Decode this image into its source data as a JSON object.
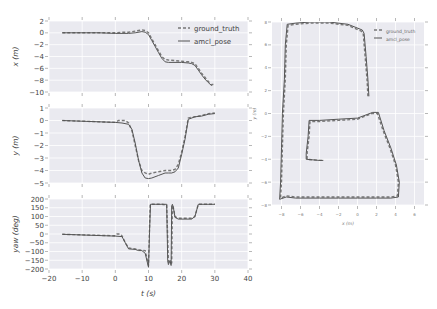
{
  "colors": {
    "plot_bg": "#eaeaf0",
    "grid": "#ffffff",
    "ground_truth": "#777777",
    "amcl_pose": "#555555"
  },
  "chart_data": [
    {
      "id": "x_vs_t",
      "type": "line",
      "title": "",
      "xlabel": "",
      "ylabel": "x (m)",
      "xlim": [
        -20,
        40
      ],
      "ylim": [
        -10,
        2
      ],
      "xticks": [],
      "yticks": [
        "2",
        "0",
        "−2",
        "−4",
        "−6",
        "−8",
        "−10"
      ],
      "ytick_values": [
        2,
        0,
        -2,
        -4,
        -6,
        -8,
        -10
      ],
      "grid": true,
      "legend": {
        "placement": "top-right",
        "entries": [
          "ground_truth",
          "amcl_pose"
        ]
      },
      "series": [
        {
          "name": "ground_truth",
          "style": "dashed",
          "x": [
            -16,
            -5,
            0,
            2,
            4,
            6,
            8,
            9,
            10,
            11,
            12,
            13,
            14,
            15,
            16,
            18,
            20,
            22,
            23,
            24,
            25,
            26,
            27,
            28,
            29,
            30
          ],
          "y": [
            0,
            0,
            0,
            0.1,
            0.1,
            0.3,
            0.5,
            0.4,
            0,
            -1,
            -2,
            -3,
            -4,
            -4.5,
            -4.6,
            -4.7,
            -4.8,
            -4.9,
            -5,
            -5.2,
            -6,
            -6.8,
            -7.5,
            -8.2,
            -8.8,
            -8.6
          ]
        },
        {
          "name": "amcl_pose",
          "style": "solid",
          "x": [
            -16,
            -5,
            0,
            2,
            4,
            6,
            8,
            9,
            10,
            11,
            12,
            13,
            14,
            15,
            16,
            18,
            20,
            22,
            23,
            24,
            25,
            26,
            27,
            28,
            29
          ],
          "y": [
            0,
            0,
            -0.1,
            -0.1,
            -0.1,
            0,
            0.2,
            0.1,
            -0.3,
            -1.3,
            -2.3,
            -3.3,
            -4.3,
            -4.9,
            -5,
            -5,
            -5,
            -5.1,
            -5.2,
            -5.5,
            -6.3,
            -7.1,
            -7.8,
            -8.4,
            -8.9
          ]
        }
      ]
    },
    {
      "id": "y_vs_t",
      "type": "line",
      "title": "",
      "xlabel": "",
      "ylabel": "y (m)",
      "xlim": [
        -20,
        40
      ],
      "ylim": [
        -5,
        1
      ],
      "xticks": [],
      "yticks": [
        "1",
        "0",
        "−1",
        "−2",
        "−3",
        "−4",
        "−5"
      ],
      "ytick_values": [
        1,
        0,
        -1,
        -2,
        -3,
        -4,
        -5
      ],
      "grid": true,
      "series": [
        {
          "name": "ground_truth",
          "style": "dashed",
          "x": [
            -16,
            -5,
            0,
            1,
            3,
            4,
            5,
            6,
            7,
            8,
            9,
            10,
            11,
            13,
            15,
            17,
            18,
            19,
            20,
            21,
            22,
            24,
            26,
            28,
            30
          ],
          "y": [
            0,
            -0.1,
            -0.15,
            0,
            0,
            -0.2,
            -0.8,
            -2,
            -3.2,
            -4,
            -4.2,
            -4.3,
            -4.2,
            -4.1,
            -4,
            -4,
            -3.9,
            -3.5,
            -2.5,
            -1.3,
            0.2,
            0.3,
            0.4,
            0.55,
            0.6
          ]
        },
        {
          "name": "amcl_pose",
          "style": "solid",
          "x": [
            -16,
            -5,
            0,
            2,
            4,
            5,
            6,
            7,
            8,
            9,
            10,
            11,
            13,
            15,
            16,
            17,
            18,
            19,
            20,
            21,
            22,
            24,
            26,
            28,
            30
          ],
          "y": [
            0,
            -0.1,
            -0.15,
            -0.2,
            -0.3,
            -0.7,
            -1.8,
            -3.2,
            -4.2,
            -4.6,
            -4.65,
            -4.6,
            -4.4,
            -4.2,
            -4.2,
            -4.2,
            -4.1,
            -3.8,
            -2.7,
            -1.5,
            0.1,
            0.3,
            0.35,
            0.5,
            0.55
          ]
        }
      ]
    },
    {
      "id": "yaw_vs_t",
      "type": "line",
      "title": "",
      "xlabel": "t (s)",
      "ylabel": "yaw (deg)",
      "xlim": [
        -20,
        40
      ],
      "ylim": [
        -200,
        200
      ],
      "xticks": [
        "−20",
        "−10",
        "0",
        "10",
        "20",
        "30",
        "40"
      ],
      "xtick_values": [
        -20,
        -10,
        0,
        10,
        20,
        30,
        40
      ],
      "yticks": [
        "200",
        "150",
        "100",
        "50",
        "0",
        "−50",
        "−100",
        "−150",
        "−200"
      ],
      "ytick_values": [
        200,
        150,
        100,
        50,
        0,
        -50,
        -100,
        -150,
        -200
      ],
      "grid": true,
      "series": [
        {
          "name": "ground_truth",
          "style": "dashed",
          "x": [
            -16,
            0,
            0.5,
            1.5,
            2,
            3,
            4,
            6,
            7,
            9,
            10,
            10.5,
            11,
            12,
            14,
            15.5,
            16,
            16.5,
            17,
            17.2,
            17.5,
            18,
            19,
            21,
            23,
            24,
            25,
            27,
            30
          ],
          "y": [
            -2,
            -10,
            0,
            0,
            -10,
            -50,
            -80,
            -85,
            -90,
            -95,
            -180,
            170,
            170,
            170,
            170,
            165,
            -160,
            -170,
            -165,
            165,
            150,
            100,
            90,
            90,
            90,
            100,
            170,
            170,
            170
          ]
        },
        {
          "name": "amcl_pose",
          "style": "solid",
          "x": [
            -16,
            0,
            2,
            3,
            4,
            6,
            7,
            8,
            9,
            10,
            10.3,
            10.6,
            11,
            12,
            14,
            15.5,
            15.8,
            16,
            16.5,
            16.8,
            17,
            17.2,
            17.5,
            18,
            19,
            21,
            23,
            24,
            25,
            27,
            30
          ],
          "y": [
            -2,
            -12,
            -15,
            -50,
            -85,
            -88,
            -95,
            -95,
            -110,
            -190,
            10,
            170,
            170,
            170,
            170,
            170,
            -150,
            -175,
            -150,
            -180,
            160,
            170,
            150,
            95,
            85,
            85,
            85,
            100,
            170,
            170,
            170
          ]
        }
      ]
    },
    {
      "id": "trajectory_xy",
      "type": "line",
      "title": "",
      "xlabel": "x (m)",
      "ylabel": "y (m)",
      "xlim": [
        -9,
        7
      ],
      "ylim": [
        -8,
        8
      ],
      "xticks": [
        "−8",
        "−6",
        "−4",
        "−2",
        "0",
        "2",
        "4",
        "6"
      ],
      "xtick_values": [
        -8,
        -6,
        -4,
        -2,
        0,
        2,
        4,
        6
      ],
      "yticks": [
        "8",
        "6",
        "4",
        "2",
        "0",
        "−2",
        "−4",
        "−6",
        "−8"
      ],
      "ytick_values": [
        8,
        6,
        4,
        2,
        0,
        -2,
        -4,
        -6,
        -8
      ],
      "grid": true,
      "legend": {
        "placement": "top-right",
        "entries": [
          "ground_truth",
          "amcl_pose"
        ]
      },
      "series": [
        {
          "name": "ground_truth",
          "style": "dashed",
          "x": [
            1.1,
            1.0,
            0.8,
            0.6,
            0.4,
            -1,
            -3,
            -5,
            -6.5,
            -7.3,
            -7.5,
            -7.6,
            -7.8,
            -7.9,
            -8.0,
            -8.1,
            -7.5,
            -6.5,
            -4,
            -2,
            0,
            2,
            3.5,
            4.2,
            4.3,
            4.0,
            3.4,
            2.7,
            2.1,
            1.5,
            0,
            -2,
            -4,
            -5.0,
            -5.1,
            -5.3,
            -5.3,
            -4,
            -3.7
          ],
          "y": [
            1.5,
            3,
            5,
            7,
            7.2,
            7.7,
            7.9,
            7.9,
            7.8,
            7.7,
            6,
            3,
            0,
            -3,
            -6,
            -7.4,
            -7.2,
            -7.3,
            -7.3,
            -7.3,
            -7.3,
            -7.3,
            -7.3,
            -7.2,
            -6,
            -4.5,
            -3,
            -1.5,
            0,
            0,
            -0.5,
            -0.6,
            -0.7,
            -0.7,
            -2,
            -3.5,
            -4.0,
            -4.1,
            -4.1
          ]
        },
        {
          "name": "amcl_pose",
          "style": "solid",
          "x": [
            1.2,
            1.1,
            0.9,
            0.7,
            0.5,
            -1,
            -3,
            -5,
            -6.5,
            -7.4,
            -7.6,
            -7.7,
            -7.9,
            -8.0,
            -8.1,
            -8.2,
            -7.5,
            -6.5,
            -4,
            -2,
            0,
            2,
            3.5,
            4.3,
            4.4,
            4.1,
            3.5,
            2.8,
            2.2,
            1.6,
            0,
            -2,
            -4,
            -5.1,
            -5.2,
            -5.4,
            -5.4,
            -4,
            -3.6
          ],
          "y": [
            1.5,
            3,
            5,
            7,
            7.3,
            7.8,
            8.0,
            8.0,
            7.9,
            7.8,
            6,
            3,
            0,
            -3,
            -6,
            -7.5,
            -7.3,
            -7.4,
            -7.4,
            -7.4,
            -7.4,
            -7.4,
            -7.4,
            -7.3,
            -6,
            -4.5,
            -3,
            -1.5,
            0.1,
            0.1,
            -0.4,
            -0.5,
            -0.6,
            -0.6,
            -2,
            -3.5,
            -4.0,
            -4.1,
            -4.1
          ]
        }
      ]
    }
  ]
}
